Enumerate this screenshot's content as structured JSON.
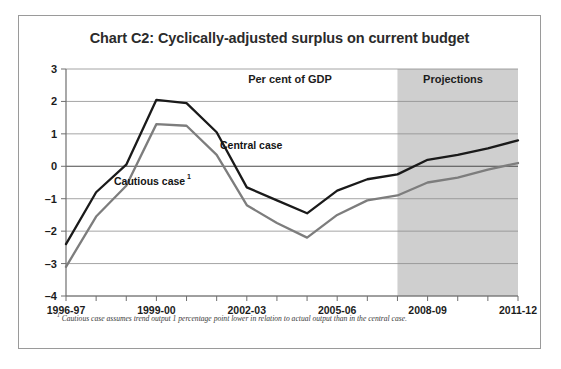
{
  "chart_data": {
    "type": "line",
    "title": "Chart C2: Cyclically-adjusted surplus on current budget",
    "xlabel": "",
    "ylabel": "",
    "unit_annotation": "Per cent of GDP",
    "projection_annotation": "Projections",
    "grid": true,
    "legend_position": "inline-annotations",
    "ylim": [
      -4,
      3
    ],
    "yticks": [
      3,
      2,
      1,
      0,
      -1,
      -2,
      -3,
      -4
    ],
    "ytick_labels": [
      "3",
      "2",
      "1",
      "0",
      "–1",
      "–2",
      "–3",
      "–4"
    ],
    "x": [
      "1996-97",
      "1997-98",
      "1998-99",
      "1999-00",
      "2000-01",
      "2001-02",
      "2002-03",
      "2003-04",
      "2004-05",
      "2005-06",
      "2006-07",
      "2007-08",
      "2008-09",
      "2009-10",
      "2010-11",
      "2011-12"
    ],
    "xtick_labels_shown": [
      "1996-97",
      "1999-00",
      "2002-03",
      "2005-06",
      "2008-09",
      "2011-12"
    ],
    "projection_start": "2007-08",
    "projection_shade_color": "#cfcfcf",
    "series": [
      {
        "name": "Central case",
        "color": "#1a1a1a",
        "label_text": "Central case",
        "values": [
          -2.4,
          -0.8,
          0.05,
          2.05,
          1.95,
          1.05,
          -0.65,
          -1.05,
          -1.45,
          -0.75,
          -0.4,
          -0.25,
          0.2,
          0.35,
          0.55,
          0.8
        ]
      },
      {
        "name": "Cautious case",
        "color": "#7d7d7d",
        "label_text": "Cautious case",
        "footnote_marker": "1",
        "values": [
          -3.1,
          -1.55,
          -0.6,
          1.3,
          1.25,
          0.35,
          -1.2,
          -1.75,
          -2.2,
          -1.5,
          -1.05,
          -0.9,
          -0.5,
          -0.35,
          -0.1,
          0.1
        ]
      }
    ],
    "footnote_marker": "1",
    "footnote": "Cautious case assumes trend output 1 percentage point lower in relation to actual output than in the central case."
  },
  "figure": {
    "border_color": "#9a9a9a",
    "background": "#ffffff"
  }
}
